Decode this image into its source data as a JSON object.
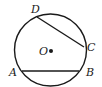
{
  "diagram": {
    "type": "circle-geometry",
    "circle": {
      "center": "O",
      "cx": 50.5,
      "cy": 50,
      "r": 36
    },
    "points": [
      {
        "name": "D",
        "x": 37,
        "y": 17,
        "label_x": 31,
        "label_y": 13
      },
      {
        "name": "C",
        "x": 84,
        "y": 47,
        "label_x": 87,
        "label_y": 51
      },
      {
        "name": "A",
        "x": 22,
        "y": 71,
        "label_x": 10,
        "label_y": 76
      },
      {
        "name": "B",
        "x": 79,
        "y": 71,
        "label_x": 86,
        "label_y": 76
      },
      {
        "name": "O",
        "x": 51,
        "y": 51,
        "label_x": 39,
        "label_y": 55
      }
    ],
    "chords": [
      {
        "from": "D",
        "to": "C"
      },
      {
        "from": "A",
        "to": "B"
      }
    ],
    "labels": {
      "D": "D",
      "C": "C",
      "A": "A",
      "B": "B",
      "O": "O"
    },
    "stroke_color": "#1a1a1a"
  }
}
